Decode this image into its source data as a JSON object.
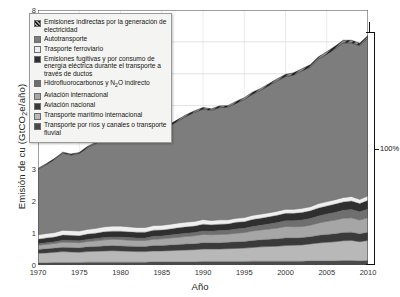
{
  "chart_data": {
    "type": "area",
    "title": "",
    "xlabel": "Año",
    "ylabel": "Emisión de cu (GtCO₂e/año)",
    "xlim": [
      1970,
      2010
    ],
    "ylim": [
      0,
      8
    ],
    "yticks": [
      0,
      1,
      2,
      3,
      4,
      5,
      6,
      7,
      8
    ],
    "xticks": [
      1970,
      1975,
      1980,
      1985,
      1990,
      1995,
      2000,
      2005,
      2010
    ],
    "grid": true,
    "legend_position": "upper-left-inside",
    "stacked": true,
    "x": [
      1970,
      1971,
      1972,
      1973,
      1974,
      1975,
      1976,
      1977,
      1978,
      1979,
      1980,
      1981,
      1982,
      1983,
      1984,
      1985,
      1986,
      1987,
      1988,
      1989,
      1990,
      1991,
      1992,
      1993,
      1994,
      1995,
      1996,
      1997,
      1998,
      1999,
      2000,
      2001,
      2002,
      2003,
      2004,
      2005,
      2006,
      2007,
      2008,
      2009,
      2010
    ],
    "series": [
      {
        "name": "Transporte por ríos y canales o transporte fluvial",
        "color": "#4a4a4a",
        "values": [
          0.07,
          0.07,
          0.08,
          0.08,
          0.08,
          0.08,
          0.09,
          0.09,
          0.09,
          0.09,
          0.09,
          0.09,
          0.09,
          0.09,
          0.1,
          0.1,
          0.1,
          0.1,
          0.1,
          0.1,
          0.11,
          0.11,
          0.11,
          0.11,
          0.11,
          0.11,
          0.12,
          0.12,
          0.12,
          0.12,
          0.12,
          0.12,
          0.12,
          0.13,
          0.13,
          0.13,
          0.13,
          0.14,
          0.14,
          0.13,
          0.14
        ]
      },
      {
        "name": "Transporte marítimo internacional",
        "color": "#b8b8b8",
        "values": [
          0.3,
          0.31,
          0.32,
          0.34,
          0.33,
          0.32,
          0.33,
          0.34,
          0.35,
          0.36,
          0.35,
          0.34,
          0.33,
          0.33,
          0.34,
          0.34,
          0.35,
          0.36,
          0.37,
          0.38,
          0.39,
          0.39,
          0.39,
          0.4,
          0.41,
          0.42,
          0.43,
          0.45,
          0.46,
          0.47,
          0.49,
          0.5,
          0.51,
          0.53,
          0.56,
          0.58,
          0.6,
          0.62,
          0.63,
          0.6,
          0.63
        ]
      },
      {
        "name": "Aviación nacional",
        "color": "#3a3a3a",
        "values": [
          0.12,
          0.13,
          0.13,
          0.14,
          0.14,
          0.14,
          0.15,
          0.15,
          0.16,
          0.16,
          0.16,
          0.16,
          0.16,
          0.16,
          0.17,
          0.17,
          0.18,
          0.18,
          0.19,
          0.19,
          0.2,
          0.2,
          0.2,
          0.2,
          0.21,
          0.21,
          0.22,
          0.22,
          0.23,
          0.23,
          0.24,
          0.23,
          0.23,
          0.23,
          0.24,
          0.25,
          0.25,
          0.26,
          0.26,
          0.25,
          0.26
        ]
      },
      {
        "name": "Aviación internacional",
        "color": "#a6a6a6",
        "values": [
          0.13,
          0.14,
          0.15,
          0.16,
          0.16,
          0.16,
          0.17,
          0.18,
          0.19,
          0.2,
          0.2,
          0.19,
          0.19,
          0.19,
          0.2,
          0.21,
          0.22,
          0.23,
          0.24,
          0.25,
          0.26,
          0.25,
          0.26,
          0.26,
          0.27,
          0.28,
          0.3,
          0.31,
          0.32,
          0.34,
          0.36,
          0.35,
          0.35,
          0.36,
          0.39,
          0.41,
          0.43,
          0.45,
          0.45,
          0.43,
          0.46
        ]
      },
      {
        "name": "Hidrofluorocarbonos y N₂O indirecto",
        "color": "#6f6f6f",
        "values": [
          0.05,
          0.05,
          0.05,
          0.06,
          0.06,
          0.06,
          0.06,
          0.07,
          0.07,
          0.07,
          0.08,
          0.08,
          0.08,
          0.08,
          0.09,
          0.09,
          0.09,
          0.1,
          0.1,
          0.1,
          0.11,
          0.11,
          0.12,
          0.12,
          0.13,
          0.13,
          0.14,
          0.15,
          0.16,
          0.17,
          0.18,
          0.19,
          0.2,
          0.21,
          0.22,
          0.23,
          0.24,
          0.25,
          0.26,
          0.26,
          0.27
        ]
      },
      {
        "name": "Emisiones fugitivas y por consumo de energía eléctrica durante el transporte a través de ductos",
        "color": "#2f2f2f",
        "values": [
          0.14,
          0.15,
          0.15,
          0.16,
          0.16,
          0.16,
          0.17,
          0.17,
          0.18,
          0.18,
          0.18,
          0.18,
          0.18,
          0.18,
          0.19,
          0.19,
          0.19,
          0.2,
          0.2,
          0.2,
          0.21,
          0.2,
          0.2,
          0.2,
          0.21,
          0.21,
          0.22,
          0.22,
          0.22,
          0.23,
          0.23,
          0.23,
          0.24,
          0.24,
          0.25,
          0.25,
          0.26,
          0.26,
          0.27,
          0.26,
          0.27
        ]
      },
      {
        "name": "Trasporte ferroviario",
        "color": "#efefef",
        "values": [
          0.14,
          0.14,
          0.14,
          0.15,
          0.15,
          0.15,
          0.15,
          0.15,
          0.16,
          0.16,
          0.16,
          0.16,
          0.15,
          0.15,
          0.15,
          0.15,
          0.15,
          0.15,
          0.15,
          0.15,
          0.15,
          0.14,
          0.14,
          0.13,
          0.13,
          0.13,
          0.13,
          0.13,
          0.13,
          0.13,
          0.13,
          0.13,
          0.13,
          0.13,
          0.14,
          0.14,
          0.14,
          0.14,
          0.14,
          0.13,
          0.14
        ]
      },
      {
        "name": "Autotransporte",
        "color": "#7d7d7d",
        "values": [
          2.05,
          2.16,
          2.29,
          2.42,
          2.37,
          2.43,
          2.56,
          2.66,
          2.79,
          2.83,
          2.76,
          2.72,
          2.73,
          2.78,
          2.88,
          2.97,
          3.09,
          3.2,
          3.32,
          3.42,
          3.46,
          3.45,
          3.52,
          3.53,
          3.6,
          3.7,
          3.8,
          3.88,
          3.99,
          4.09,
          4.16,
          4.21,
          4.31,
          4.38,
          4.53,
          4.62,
          4.73,
          4.85,
          4.82,
          4.82,
          4.95
        ]
      },
      {
        "name": "Emisiones indirectas por la generación de electricidad",
        "color": "#555555",
        "hatch": true,
        "values": [
          0.03,
          0.03,
          0.03,
          0.03,
          0.03,
          0.03,
          0.04,
          0.04,
          0.04,
          0.04,
          0.04,
          0.04,
          0.04,
          0.04,
          0.04,
          0.05,
          0.05,
          0.05,
          0.05,
          0.05,
          0.05,
          0.05,
          0.05,
          0.05,
          0.06,
          0.06,
          0.06,
          0.06,
          0.06,
          0.06,
          0.07,
          0.07,
          0.07,
          0.07,
          0.07,
          0.08,
          0.08,
          0.08,
          0.08,
          0.08,
          0.08
        ]
      }
    ],
    "annotations": [
      {
        "name": "total-bracket-label",
        "text": "100%",
        "x": 2010,
        "y": 3.55
      }
    ]
  },
  "legend": {
    "items": [
      {
        "label": "Emisiones indirectas por la generación de electricidad",
        "color": "#555555",
        "hatch": true
      },
      {
        "label": "Autotransporte",
        "color": "#7d7d7d",
        "hatch": false
      },
      {
        "label": "Trasporte ferroviario",
        "color": "#efefef",
        "hatch": false
      },
      {
        "label": "Emisiones fugitivas y por consumo de energía eléctrica durante el transporte a través de ductos",
        "color": "#2f2f2f",
        "hatch": false
      },
      {
        "label": "Hidrofluorocarbonos y N₂O indirecto",
        "color": "#6f6f6f",
        "hatch": false
      },
      {
        "label": "Aviación internacional",
        "color": "#a6a6a6",
        "hatch": false
      },
      {
        "label": "Aviación nacional",
        "color": "#3a3a3a",
        "hatch": false
      },
      {
        "label": "Transporte marítimo internacional",
        "color": "#b8b8b8",
        "hatch": false
      },
      {
        "label": "Transporte por ríos y canales o transporte fluvial",
        "color": "#4a4a4a",
        "hatch": false
      }
    ]
  }
}
